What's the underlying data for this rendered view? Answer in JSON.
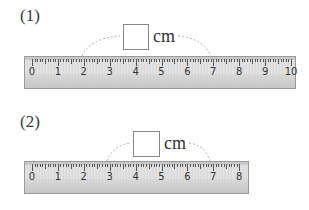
{
  "problems": [
    {
      "label": "(1)",
      "unit": "cm",
      "answer_box_value": "",
      "ruler": {
        "min": 0,
        "max": 10,
        "numbers": [
          "0",
          "1",
          "2",
          "3",
          "4",
          "5",
          "6",
          "7",
          "8",
          "9",
          "10"
        ]
      },
      "measure_from": 2,
      "measure_to": 7
    },
    {
      "label": "(2)",
      "unit": "cm",
      "answer_box_value": "",
      "ruler": {
        "min": 0,
        "max": 8,
        "numbers": [
          "0",
          "1",
          "2",
          "3",
          "4",
          "5",
          "6",
          "7",
          "8"
        ]
      },
      "measure_from": 3,
      "measure_to": 7
    }
  ],
  "colors": {
    "ruler_bg": "#e0e0e0",
    "ruler_border": "#9a9a9a",
    "arc": "#aaaaaa",
    "text": "#333333"
  }
}
